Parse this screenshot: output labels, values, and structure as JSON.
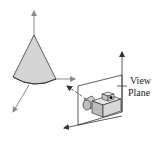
{
  "diagram": {
    "labels": {
      "view_plane_line1": "View",
      "view_plane_line2": "Plane"
    },
    "colors": {
      "axis": "#8a8a8a",
      "outline": "#333333",
      "cone_fill": "#d4d4d4",
      "camera_fill": "#d8d8d8",
      "camera_dark": "#b0b0b0",
      "plane_line": "#333333",
      "background": "#ffffff"
    },
    "elements": [
      {
        "name": "world-axes",
        "type": "3-axis arrows"
      },
      {
        "name": "cone",
        "type": "shaded cone"
      },
      {
        "name": "view-plane",
        "type": "parallelogram"
      },
      {
        "name": "camera",
        "type": "camera icon"
      },
      {
        "name": "view-direction",
        "type": "dashed arrow"
      }
    ]
  }
}
